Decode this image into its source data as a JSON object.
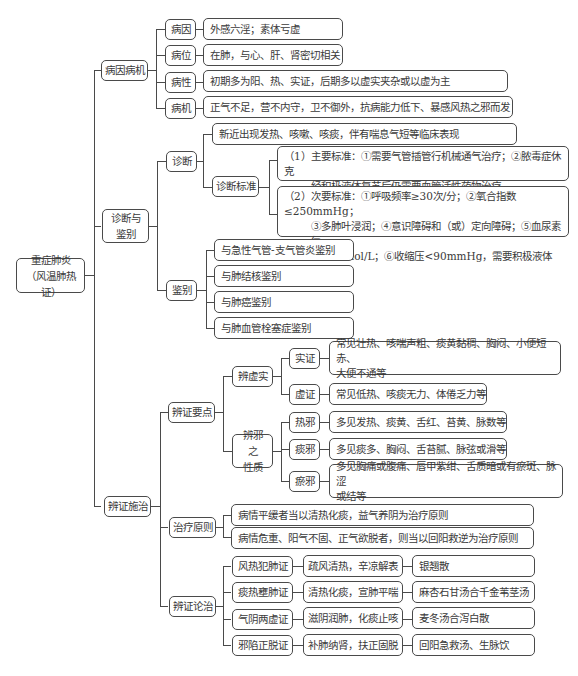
{
  "root": {
    "line1": "重症肺炎",
    "line2": "（风温肺热证）"
  },
  "branch1": {
    "label": "病因病机",
    "items": [
      {
        "key": "病因",
        "text": "外感六淫；素体亏虚"
      },
      {
        "key": "病位",
        "text": "在肺，与心、肝、肾密切相关"
      },
      {
        "key": "病性",
        "text": "初期多为阳、热、实证，后期多以虚实夹杂或以虚为主"
      },
      {
        "key": "病机",
        "text": "正气不足，营不内守，卫不御外，抗病能力低下、暴感风热之邪而发"
      }
    ]
  },
  "branch2": {
    "label_line1": "诊断与",
    "label_line2": "鉴别",
    "diagnosis": {
      "label": "诊断",
      "presentation": "新近出现发热、咳嗽、咳痰，伴有喘息气短等临床表现",
      "criteria_label": "诊断标准",
      "major_line1": "（1）主要标准：①需要气管插管行机械通气治疗；②脓毒症休克",
      "major_line2": "经积极液体复苏后仍需要血管活性药物治疗",
      "minor_line1": "（2）次要标准：①呼吸频率≥30次/分；②氧合指数≤250mmHg；",
      "minor_line2": "③多肺叶浸润；④意识障碍和（或）定向障碍；⑤血尿素氮≥",
      "minor_line3": "7.14mmol/L；⑥收缩压<90mmHg，需要积极液体复苏"
    },
    "differential": {
      "label": "鉴别",
      "items": [
        "与急性气管-支气管炎鉴别",
        "与肺结核鉴别",
        "与肺癌鉴别",
        "与肺血管栓塞症鉴别"
      ]
    }
  },
  "branch3": {
    "label": "辨证施治",
    "key_points": {
      "label": "辨证要点",
      "deficiency_excess": {
        "label": "辨虚实",
        "items": [
          {
            "key": "实证",
            "text_line1": "常见壮热、咳喘声粗、痰黄黏稠、胸闷、小便短赤、",
            "text_line2": "大便不通等"
          },
          {
            "key": "虚证",
            "text_line1": "常见低热、咳痰无力、体倦乏力等",
            "text_line2": ""
          }
        ]
      },
      "pathogen_nature": {
        "label_line1": "辨邪之",
        "label_line2": "性质",
        "items": [
          {
            "key": "热邪",
            "text_line1": "多见发热、痰黄、舌红、苔黄、脉数等",
            "text_line2": ""
          },
          {
            "key": "痰邪",
            "text_line1": "多见痰多、胸闷、舌苔腻、脉弦或滑等",
            "text_line2": ""
          },
          {
            "key": "瘀邪",
            "text_line1": "多见胸痛或腹痛、唇甲紫绀、舌质暗或有瘀斑、脉涩",
            "text_line2": "或结等"
          }
        ]
      }
    },
    "principles": {
      "label": "治疗原则",
      "items": [
        "病情平缓者当以清热化痰，益气养阴为治疗原则",
        "病情危重、阳气不固、正气欲脱者，则当以回阳救逆为治疗原则"
      ]
    },
    "syndromes": {
      "label": "辨证论治",
      "items": [
        {
          "syndrome": "风热犯肺证",
          "method": "疏风清热，辛凉解表",
          "formula": "银翘散"
        },
        {
          "syndrome": "痰热壅肺证",
          "method": "清热化痰，宣肺平喘",
          "formula": "麻杏石甘汤合千金苇茎汤"
        },
        {
          "syndrome": "气阴两虚证",
          "method": "滋阴润肺，化痰止咳",
          "formula": "麦冬汤合泻白散"
        },
        {
          "syndrome": "邪陷正脱证",
          "method": "补肺纳肾，扶正固脱",
          "formula": "回阳急救汤、生脉饮"
        }
      ]
    }
  }
}
